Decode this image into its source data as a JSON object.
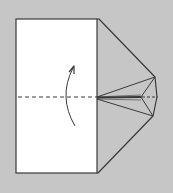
{
  "diagram": {
    "type": "origami-step",
    "colors": {
      "background": "#c6c6c6",
      "paper_front": "#ffffff",
      "paper_back": "#c6c6c6",
      "line": "#3a3a3a"
    },
    "elements": {
      "paper_rect": {
        "x": 16,
        "y": 19,
        "w": 81,
        "h": 154
      },
      "flap_outline": [
        [
          97,
          19
        ],
        [
          99,
          19
        ],
        [
          155,
          77
        ],
        [
          157,
          97
        ],
        [
          153,
          116
        ],
        [
          98,
          173
        ],
        [
          97,
          173
        ]
      ],
      "fold_line_y": 97,
      "arrow": {
        "from": [
          75,
          126
        ],
        "control": [
          60,
          97
        ],
        "to": [
          73,
          67
        ],
        "direction": "up"
      },
      "crease_center": [
        141,
        97
      ]
    }
  }
}
